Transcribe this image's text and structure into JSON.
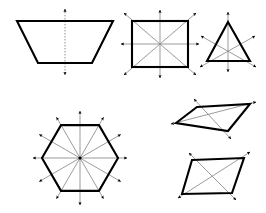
{
  "diagram": {
    "background_color": "#ffffff",
    "outline_color": "#000000",
    "symmetry_line_color": "#8a8a8a",
    "arrow_color": "#000000",
    "canvas": {
      "width": 266,
      "height": 213
    },
    "figures": [
      {
        "id": "trapezoid",
        "name": "Isosceles Trapezoid",
        "position": "top-left",
        "symmetry_line_count": 1,
        "arrowhead_count": 2,
        "line_style": "dotted",
        "vertices": [
          [
            17,
            21
          ],
          [
            113,
            21
          ],
          [
            92,
            63
          ],
          [
            38,
            63
          ]
        ],
        "symmetry_lines": [
          {
            "type": "vertical",
            "x1": 65,
            "y1": 8,
            "x2": 65,
            "y2": 76
          }
        ]
      },
      {
        "id": "square",
        "name": "Square",
        "position": "top-middle",
        "symmetry_line_count": 4,
        "arrowhead_count": 8,
        "line_style": "solid",
        "vertices": [
          [
            132,
            21
          ],
          [
            188,
            21
          ],
          [
            188,
            67
          ],
          [
            132,
            67
          ]
        ],
        "center": [
          160,
          44
        ],
        "symmetry_lines": [
          {
            "type": "vertical"
          },
          {
            "type": "horizontal"
          },
          {
            "type": "diagonal-tlbr"
          },
          {
            "type": "diagonal-trbl"
          }
        ]
      },
      {
        "id": "triangle",
        "name": "Equilateral Triangle",
        "position": "top-right",
        "symmetry_line_count": 3,
        "arrowhead_count": 6,
        "line_style": "solid",
        "vertices": [
          [
            228,
            22
          ],
          [
            250,
            61
          ],
          [
            207,
            61
          ]
        ],
        "center": [
          228,
          48
        ],
        "symmetry_lines": [
          {
            "type": "apex-to-base"
          },
          {
            "type": "left-vertex-to-opposite-side"
          },
          {
            "type": "right-vertex-to-opposite-side"
          }
        ]
      },
      {
        "id": "hexagon",
        "name": "Regular Hexagon",
        "position": "bottom-left",
        "symmetry_line_count": 6,
        "arrowhead_count": 12,
        "line_style": "solid",
        "center": [
          80,
          158
        ],
        "radius": 38,
        "orientation": "flat-top",
        "symmetry_lines": [
          {
            "type": "vertex-to-vertex",
            "angle_deg": 0
          },
          {
            "type": "edge-midpoint-to-edge-midpoint",
            "angle_deg": 30
          },
          {
            "type": "vertex-to-vertex",
            "angle_deg": 60
          },
          {
            "type": "edge-midpoint-to-edge-midpoint",
            "angle_deg": 90
          },
          {
            "type": "vertex-to-vertex",
            "angle_deg": 120
          },
          {
            "type": "edge-midpoint-to-edge-midpoint",
            "angle_deg": 150
          }
        ]
      },
      {
        "id": "thin-parallelogram",
        "name": "Thin Parallelogram",
        "position": "middle-right",
        "symmetry_line_count": 0,
        "arrowhead_count": 4,
        "line_style": "solid",
        "note": "diagonals drawn, not lines of symmetry",
        "vertices": [
          [
            197,
            107
          ],
          [
            250,
            104
          ],
          [
            228,
            131
          ],
          [
            176,
            123
          ]
        ],
        "diagonals": [
          {
            "from": [
              197,
              107
            ],
            "to": [
              228,
              131
            ]
          },
          {
            "from": [
              176,
              123
            ],
            "to": [
              250,
              104
            ]
          }
        ]
      },
      {
        "id": "rhombus",
        "name": "Rhombus",
        "position": "bottom-right",
        "symmetry_line_count": 0,
        "arrowhead_count": 4,
        "line_style": "solid",
        "note": "diagonals drawn, not lines of symmetry",
        "vertices": [
          [
            192,
            160
          ],
          [
            244,
            158
          ],
          [
            232,
            193
          ],
          [
            182,
            194
          ]
        ],
        "diagonals": [
          {
            "from": [
              192,
              160
            ],
            "to": [
              232,
              193
            ]
          },
          {
            "from": [
              182,
              194
            ],
            "to": [
              244,
              158
            ]
          }
        ]
      }
    ]
  }
}
